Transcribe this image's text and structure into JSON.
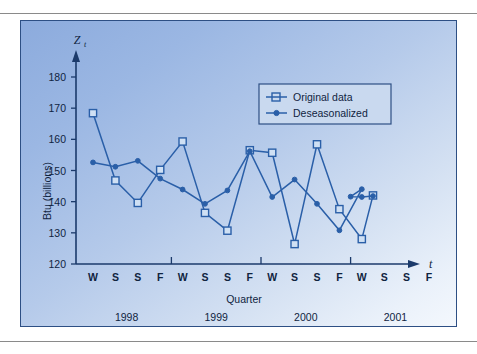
{
  "page": {
    "rule_top": "horizontal-rule",
    "rule_bottom": "horizontal-rule"
  },
  "figure": {
    "panel_name": "time-series-figure-panel",
    "border_color": "#2d4f84",
    "background_from": "#8cabdd",
    "background_to": "#f4f8fd"
  },
  "chart_data": {
    "type": "line",
    "title": "",
    "xlabel": "Quarter",
    "ylabel": "Btu (billions)",
    "y_axis_variable": "Z",
    "y_axis_variable_subscript": "t",
    "x_axis_variable": "t",
    "ylim": [
      120,
      185
    ],
    "yticks": [
      120,
      130,
      140,
      150,
      160,
      170,
      180
    ],
    "ytick_labels": [
      "120",
      "130",
      "140",
      "150",
      "160",
      "170",
      "180"
    ],
    "grid": false,
    "legend_position": "upper-right",
    "x_tick_labels": [
      "W",
      "S",
      "S",
      "F",
      "W",
      "S",
      "S",
      "F",
      "W",
      "S",
      "S",
      "F",
      "W",
      "S",
      "S",
      "F"
    ],
    "x_group_labels": [
      "1998",
      "1999",
      "2000",
      "2001"
    ],
    "x_index_count": 16,
    "series": [
      {
        "name": "Original data",
        "marker": "open-square",
        "color": "#2a5fa8",
        "x_index": [
          0,
          1,
          2,
          3,
          4,
          5,
          6,
          7,
          8,
          9,
          10,
          11,
          12
        ],
        "values": [
          168.4,
          146.8,
          139.6,
          150.2,
          159.3,
          136.4,
          130.7,
          156.5,
          155.7,
          126.4,
          158.4,
          137.6,
          128.0
        ]
      },
      {
        "name": "Deseasonalized",
        "marker": "filled-dot",
        "color": "#2a5fa8",
        "x_index": [
          0,
          1,
          2,
          3,
          4,
          5,
          6,
          7,
          8,
          9,
          10,
          11,
          12
        ],
        "values": [
          152.6,
          151.2,
          153.1,
          147.4,
          143.9,
          139.3,
          143.6,
          156.2,
          141.5,
          147.1,
          139.3,
          130.8,
          144.0
        ]
      }
    ],
    "extra_points": {
      "note": "final original-data square and deseasonalized dots extend to index 12-13",
      "original_tail_x": [
        12.5
      ],
      "original_tail_values": [
        142.0
      ],
      "deseason_tail_x": [
        11.5,
        12.0,
        12.5
      ],
      "deseason_tail_values": [
        141.6,
        141.5,
        141.8
      ]
    },
    "legend": [
      {
        "label": "Original data",
        "marker": "open-square"
      },
      {
        "label": "Deseasonalized",
        "marker": "filled-dot"
      }
    ]
  }
}
